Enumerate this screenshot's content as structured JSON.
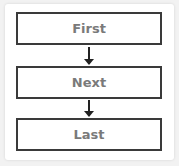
{
  "flow": {
    "steps": [
      {
        "label": "First"
      },
      {
        "label": "Next"
      },
      {
        "label": "Last"
      }
    ],
    "colors": {
      "border": "#3a3a3a",
      "text": "#7a7a7a",
      "arrow": "#222222"
    }
  }
}
